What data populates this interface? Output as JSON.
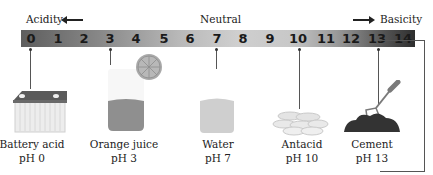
{
  "scale": {
    "left_label": "Acidity",
    "center_label": "Neutral",
    "right_label": "Basicity",
    "ticks": [
      "0",
      "1",
      "2",
      "3",
      "4",
      "5",
      "6",
      "7",
      "8",
      "9",
      "10",
      "11",
      "12",
      "13",
      "14"
    ]
  },
  "examples": [
    {
      "name": "Battery acid",
      "ph": "pH 0",
      "value": 0,
      "icon": "battery-icon"
    },
    {
      "name": "Orange juice",
      "ph": "pH 3",
      "value": 3,
      "icon": "orange-juice-icon"
    },
    {
      "name": "Water",
      "ph": "pH 7",
      "value": 7,
      "icon": "water-glass-icon"
    },
    {
      "name": "Antacid",
      "ph": "pH 10",
      "value": 10,
      "icon": "antacid-tablets-icon"
    },
    {
      "name": "Cement",
      "ph": "pH 13",
      "value": 13,
      "icon": "cement-trowel-icon"
    }
  ],
  "colors": {
    "acid_end": "#5e5e5e",
    "neutral": "#cfcfcf",
    "base_end": "#2e2e2e"
  }
}
